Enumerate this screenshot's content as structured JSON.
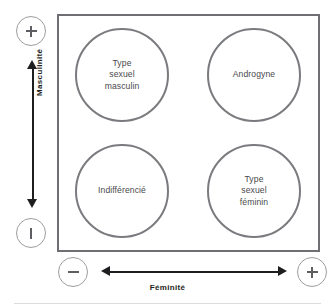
{
  "figure": {
    "colors": {
      "box_border": "#6e6f72",
      "circle_border": "#7a7b7e",
      "circle_text": "#4a4a4c",
      "axis": "#1e1e20",
      "bubble_border": "#9c9da0",
      "footer_rule": "#dcdcde",
      "background": "#ffffff"
    }
  },
  "axes": {
    "vertical": {
      "label": "Masculinité",
      "high_marker": "+",
      "low_marker": "−",
      "high_marker_name": "plus-icon",
      "low_marker_name": "minus-icon"
    },
    "horizontal": {
      "label": "Féminité",
      "low_marker": "−",
      "high_marker": "+",
      "low_marker_name": "minus-icon",
      "high_marker_name": "plus-icon"
    }
  },
  "quadrants": [
    {
      "id": "masculin",
      "label": "Type\nsexuel\nmasculin",
      "position": "top-left",
      "masculinity": "+",
      "femininity": "−"
    },
    {
      "id": "androgyne",
      "label": "Androgyne",
      "position": "top-right",
      "masculinity": "+",
      "femininity": "+"
    },
    {
      "id": "indifferencie",
      "label": "Indifférencié",
      "position": "bottom-left",
      "masculinity": "−",
      "femininity": "−"
    },
    {
      "id": "feminin",
      "label": "Type\nsexuel\nféminin",
      "position": "bottom-right",
      "masculinity": "−",
      "femininity": "+"
    }
  ]
}
